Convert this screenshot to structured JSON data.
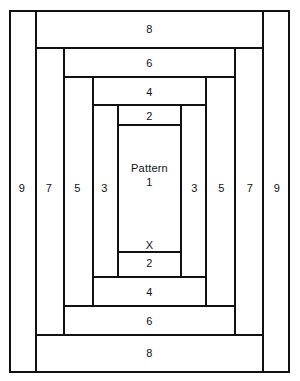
{
  "diagram": {
    "background_color": "#ffffff",
    "line_color": "#111111",
    "center_label": "Pattern\n1",
    "mark_label": "X",
    "frames": [
      {
        "name": "frame-9",
        "label": "9",
        "x": 9,
        "y": 10,
        "w": 281,
        "h": 363
      },
      {
        "name": "frame-8",
        "label": "8",
        "x": 35,
        "y": 10,
        "w": 229,
        "h": 363
      },
      {
        "name": "frame-7",
        "label": "7",
        "x": 35,
        "y": 47,
        "w": 229,
        "h": 289
      },
      {
        "name": "frame-6",
        "label": "6",
        "x": 63,
        "y": 47,
        "w": 173,
        "h": 289
      },
      {
        "name": "frame-5",
        "label": "5",
        "x": 63,
        "y": 76,
        "w": 173,
        "h": 231
      },
      {
        "name": "frame-4",
        "label": "4",
        "x": 92,
        "y": 76,
        "w": 115,
        "h": 231
      },
      {
        "name": "frame-3",
        "label": "3",
        "x": 92,
        "y": 104,
        "w": 115,
        "h": 174
      },
      {
        "name": "frame-2",
        "label": "2",
        "x": 117,
        "y": 104,
        "w": 65,
        "h": 174
      },
      {
        "name": "frame-1",
        "label": "",
        "x": 117,
        "y": 124,
        "w": 65,
        "h": 129
      }
    ],
    "labels": [
      {
        "name": "label-9-left",
        "text": "9",
        "x": 9,
        "y": 179,
        "w": 26,
        "h": 18
      },
      {
        "name": "label-9-right",
        "text": "9",
        "x": 264,
        "y": 179,
        "w": 26,
        "h": 18
      },
      {
        "name": "label-7-left",
        "text": "7",
        "x": 35,
        "y": 179,
        "w": 28,
        "h": 18
      },
      {
        "name": "label-7-right",
        "text": "7",
        "x": 236,
        "y": 179,
        "w": 28,
        "h": 18
      },
      {
        "name": "label-5-left",
        "text": "5",
        "x": 63,
        "y": 179,
        "w": 29,
        "h": 18
      },
      {
        "name": "label-5-right",
        "text": "5",
        "x": 207,
        "y": 179,
        "w": 29,
        "h": 18
      },
      {
        "name": "label-3-left",
        "text": "3",
        "x": 92,
        "y": 179,
        "w": 25,
        "h": 18
      },
      {
        "name": "label-3-right",
        "text": "3",
        "x": 182,
        "y": 179,
        "w": 25,
        "h": 18
      },
      {
        "name": "label-8-top",
        "text": "8",
        "x": 35,
        "y": 20,
        "w": 229,
        "h": 18
      },
      {
        "name": "label-8-bottom",
        "text": "8",
        "x": 35,
        "y": 344,
        "w": 229,
        "h": 18
      },
      {
        "name": "label-6-top",
        "text": "6",
        "x": 63,
        "y": 54,
        "w": 173,
        "h": 18
      },
      {
        "name": "label-6-bottom",
        "text": "6",
        "x": 63,
        "y": 312,
        "w": 173,
        "h": 18
      },
      {
        "name": "label-4-top",
        "text": "4",
        "x": 92,
        "y": 83,
        "w": 115,
        "h": 18
      },
      {
        "name": "label-4-bottom",
        "text": "4",
        "x": 92,
        "y": 283,
        "w": 115,
        "h": 18
      },
      {
        "name": "label-2-top",
        "text": "2",
        "x": 117,
        "y": 108,
        "w": 65,
        "h": 16
      },
      {
        "name": "label-2-bottom",
        "text": "2",
        "x": 117,
        "y": 255,
        "w": 65,
        "h": 16
      },
      {
        "name": "label-x",
        "text": "X",
        "x": 117,
        "y": 238,
        "w": 65,
        "h": 14
      }
    ],
    "center": {
      "name": "label-pattern-1",
      "x": 117,
      "y": 160,
      "w": 65,
      "h": 30
    }
  }
}
